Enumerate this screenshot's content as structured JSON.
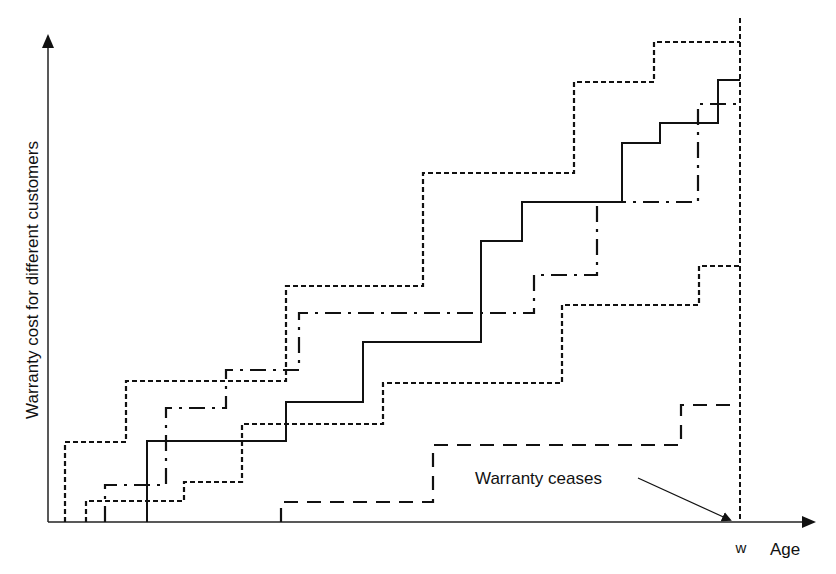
{
  "chart_data": {
    "type": "line",
    "subtype": "step",
    "title": "",
    "xlabel": "Age",
    "ylabel": "Warranty cost for different customers",
    "x_ticks": [
      {
        "label": "w",
        "x": 740
      }
    ],
    "annotations": [
      {
        "text": "Warranty ceases",
        "points_to": "w"
      }
    ],
    "grid": false,
    "legend": null,
    "units": "pixel coordinates (no numeric scale shown); origin at bottom-left of axes",
    "axes_px": {
      "origin": [
        48,
        522
      ],
      "x_end": 815,
      "y_end": 35,
      "w_line_x": 740
    },
    "series": [
      {
        "name": "customer-1",
        "style": "short-dash",
        "steps": [
          [
            65,
            442
          ],
          [
            126,
            381
          ],
          [
            286,
            286
          ],
          [
            423,
            173
          ],
          [
            574,
            82
          ],
          [
            654,
            42
          ]
        ],
        "end_x": 740
      },
      {
        "name": "customer-2",
        "style": "solid",
        "steps": [
          [
            147,
            441
          ],
          [
            286,
            402
          ],
          [
            363,
            342
          ],
          [
            481,
            241
          ],
          [
            522,
            202
          ],
          [
            622,
            143
          ],
          [
            660,
            123
          ],
          [
            718,
            80
          ]
        ],
        "end_x": 740
      },
      {
        "name": "customer-3",
        "style": "dash-dot",
        "steps": [
          [
            105,
            485
          ],
          [
            166,
            408
          ],
          [
            226,
            370
          ],
          [
            299,
            313
          ],
          [
            534,
            275
          ],
          [
            597,
            202
          ],
          [
            698,
            104
          ]
        ],
        "end_x": 740
      },
      {
        "name": "customer-4",
        "style": "short-dash",
        "steps": [
          [
            86,
            501
          ],
          [
            184,
            482
          ],
          [
            242,
            424
          ],
          [
            383,
            383
          ],
          [
            562,
            305
          ],
          [
            699,
            266
          ]
        ],
        "end_x": 740
      },
      {
        "name": "customer-5",
        "style": "long-dash",
        "steps": [
          [
            281,
            502
          ],
          [
            433,
            445
          ],
          [
            681,
            405
          ]
        ],
        "end_x": 740
      }
    ]
  },
  "labels": {
    "ylabel": "Warranty cost for different customers",
    "xlabel": "Age",
    "w_tick": "w",
    "annotation": "Warranty ceases"
  }
}
